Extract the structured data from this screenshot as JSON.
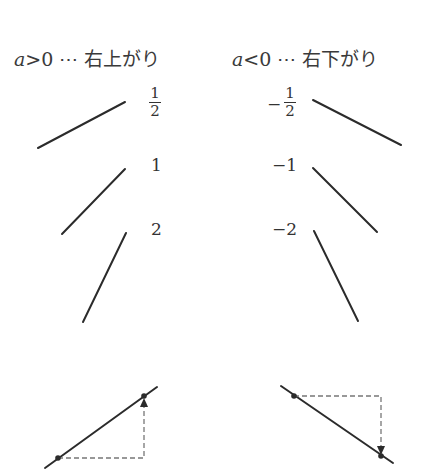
{
  "headings": {
    "positive": {
      "var": "a",
      "op": ">",
      "num": "0",
      "dots": "⋯",
      "text": "右上がり"
    },
    "negative": {
      "var": "a",
      "op": "<",
      "num": "0",
      "dots": "⋯",
      "text": "右下がり"
    }
  },
  "slopes": {
    "positive": [
      {
        "label_num": "1",
        "label_den": "2",
        "value": 0.5
      },
      {
        "label": "1",
        "value": 1
      },
      {
        "label": "2",
        "value": 2
      }
    ],
    "negative": [
      {
        "sign": "−",
        "label_num": "1",
        "label_den": "2",
        "value": -0.5
      },
      {
        "label": "−1",
        "value": -1
      },
      {
        "label": "−2",
        "value": -2
      }
    ]
  },
  "colors": {
    "line": "#2b2b2b",
    "dashed": "#777777",
    "text": "#333333"
  }
}
